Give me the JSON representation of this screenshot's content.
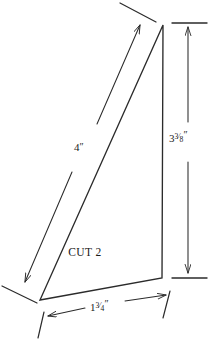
{
  "diagram": {
    "shape_label": "CUT 2",
    "line_color": "#2b2b2b",
    "background_color": "#ffffff",
    "text_color": "#1a1a1a",
    "dimensions": {
      "hypotenuse": {
        "name": "hypotenuse-dimension",
        "value": "4",
        "unit": "″",
        "display": "4″",
        "whole": "4",
        "numerator": "",
        "denominator": ""
      },
      "vertical": {
        "name": "vertical-dimension",
        "value": "3 3/8",
        "unit": "″",
        "display": "3⅜″",
        "whole": "3",
        "numerator": "3",
        "denominator": "8"
      },
      "base": {
        "name": "base-dimension",
        "value": "1 3/4",
        "unit": "″",
        "display": "1¾″",
        "whole": "1",
        "numerator": "3",
        "denominator": "4"
      }
    },
    "vertices": {
      "apex": {
        "x": 163,
        "y": 25
      },
      "bottom_right": {
        "x": 162,
        "y": 278
      },
      "bottom_left": {
        "x": 40,
        "y": 300
      }
    },
    "icons": {
      "arrow_up": "arrow-up-icon",
      "arrow_down": "arrow-down-icon",
      "arrow_left": "arrow-left-icon",
      "arrow_right": "arrow-right-icon",
      "arrow_up_right": "arrow-up-right-icon",
      "arrow_down_left": "arrow-down-left-icon"
    }
  }
}
